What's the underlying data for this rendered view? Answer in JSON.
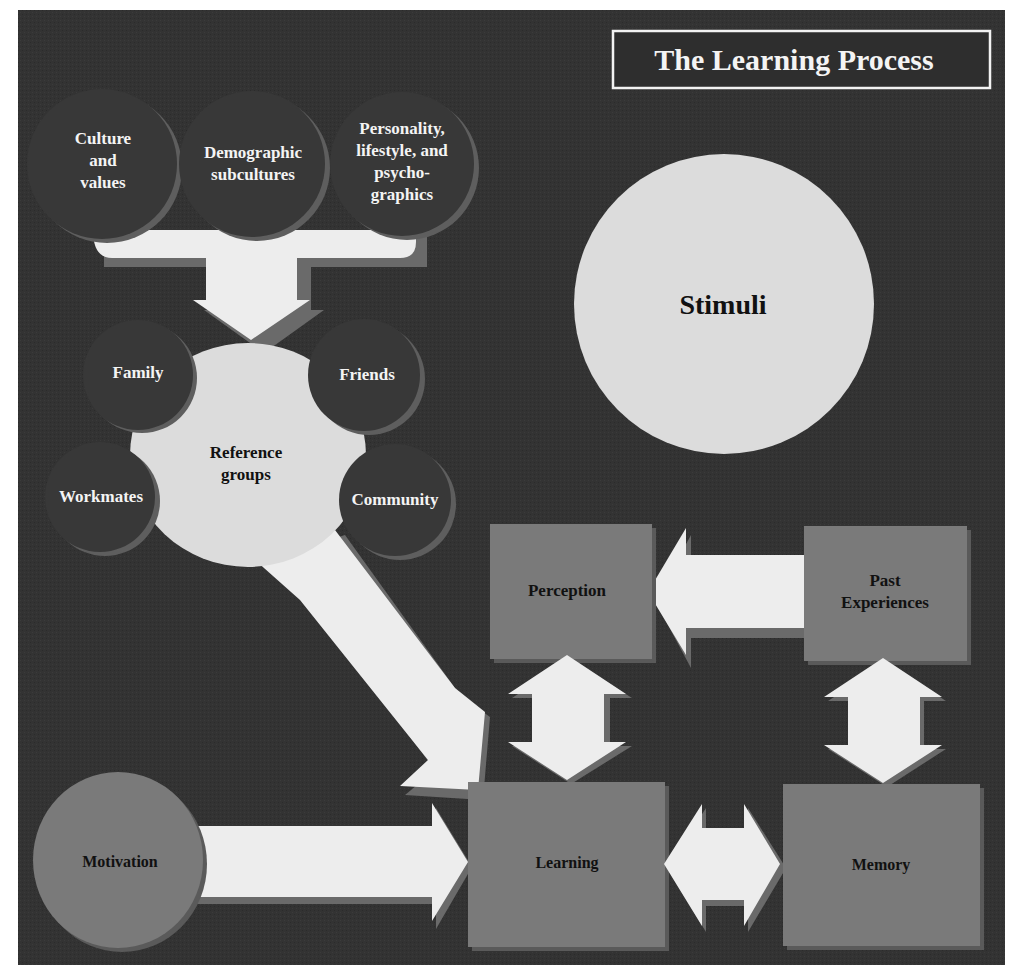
{
  "title": "The Learning Process",
  "colors": {
    "background": "#333333",
    "dark_circle": "#383838",
    "dark_circle_rim": "#5e5e5e",
    "light_shape": "#dcdcdc",
    "arrow": "#ededed",
    "arrow_shadow": "#6a6a6a",
    "box": "#7a7a7a",
    "box_shadow": "#5a5a5a",
    "title_border": "#f2f2f2"
  },
  "top_influences": [
    {
      "lines": [
        "Culture",
        "and",
        "values"
      ]
    },
    {
      "lines": [
        "Demographic",
        "subcultures"
      ]
    },
    {
      "lines": [
        "Personality,",
        "lifestyle, and",
        "psycho-",
        "graphics"
      ]
    }
  ],
  "reference_groups": {
    "center": [
      "Reference",
      "groups"
    ],
    "satellites": [
      "Family",
      "Friends",
      "Workmates",
      "Community"
    ]
  },
  "stimuli": "Stimuli",
  "boxes": {
    "perception": "Perception",
    "past_experiences": [
      "Past",
      "Experiences"
    ],
    "learning": "Learning",
    "memory": "Memory"
  },
  "motivation": "Motivation",
  "arrows": [
    {
      "from": "top_influences",
      "to": "reference_groups",
      "type": "merge-down"
    },
    {
      "from": "reference_groups",
      "to": "learning",
      "type": "diagonal"
    },
    {
      "from": "past_experiences",
      "to": "perception",
      "type": "left"
    },
    {
      "from": "perception",
      "to": "learning",
      "type": "bidirectional-vertical"
    },
    {
      "from": "past_experiences",
      "to": "memory",
      "type": "bidirectional-vertical"
    },
    {
      "from": "motivation",
      "to": "learning",
      "type": "right"
    },
    {
      "from": "learning",
      "to": "memory",
      "type": "bidirectional-horizontal"
    }
  ]
}
